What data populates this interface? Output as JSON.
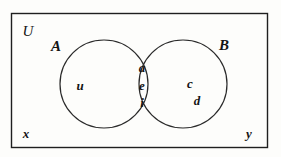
{
  "figure": {
    "type": "venn-diagram-two-set",
    "background_color": "#fdfdfb",
    "stroke_color": "#1f1f1f",
    "text_color": "#141414"
  },
  "universe": {
    "label": "U",
    "rect": {
      "x": 11,
      "y": 13,
      "width": 257,
      "height": 135
    },
    "label_position": {
      "x": 28,
      "y": 31
    }
  },
  "sets": [
    {
      "id": "A",
      "label": "A",
      "circle": {
        "cx": 104,
        "cy": 84,
        "r": 44
      },
      "label_position": {
        "x": 56,
        "y": 46
      }
    },
    {
      "id": "B",
      "label": "B",
      "circle": {
        "cx": 183,
        "cy": 84,
        "r": 44
      },
      "label_position": {
        "x": 224,
        "y": 45
      }
    }
  ],
  "elements": {
    "only_a": [
      {
        "label": "u",
        "x": 80,
        "y": 85
      }
    ],
    "intersection": [
      {
        "label": "a",
        "x": 142,
        "y": 67
      },
      {
        "label": "e",
        "x": 142,
        "y": 85
      },
      {
        "label": "i",
        "x": 142,
        "y": 102
      }
    ],
    "only_b": [
      {
        "label": "c",
        "x": 190,
        "y": 83
      },
      {
        "label": "d",
        "x": 197,
        "y": 100
      }
    ],
    "outside": [
      {
        "label": "x",
        "x": 26,
        "y": 133
      },
      {
        "label": "y",
        "x": 249,
        "y": 133
      }
    ]
  }
}
